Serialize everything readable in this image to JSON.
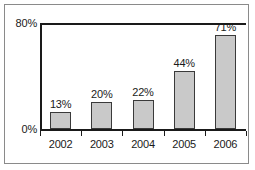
{
  "chart_data": {
    "type": "bar",
    "title": "",
    "xlabel": "",
    "ylabel": "",
    "categories": [
      "2002",
      "2003",
      "2004",
      "2005",
      "2006"
    ],
    "values": [
      13,
      20,
      22,
      44,
      71
    ],
    "value_labels": [
      "13%",
      "20%",
      "22%",
      "44%",
      "71%"
    ],
    "ylim": [
      0,
      80
    ],
    "ytick_labels": [
      "0%",
      "80%"
    ],
    "yticks": [
      0,
      80
    ],
    "grid": false,
    "legend": null,
    "bar_color": "#c9c9c9",
    "bar_border_color": "#3a3a3a",
    "axis_color": "#1a1a1a",
    "frame_color": "#8a8a8a",
    "background": "#ffffff"
  }
}
